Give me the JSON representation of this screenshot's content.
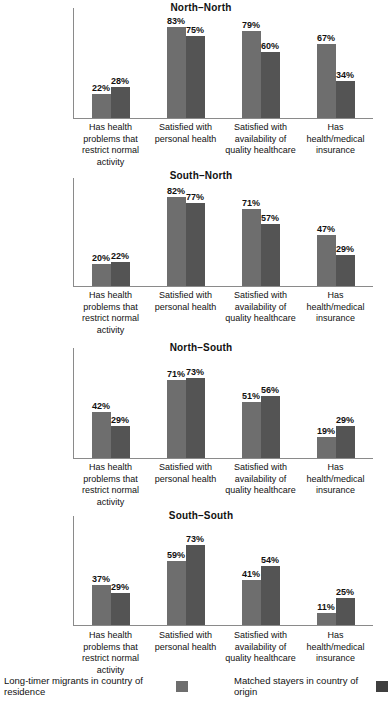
{
  "chart_data": {
    "type": "bar",
    "title": "",
    "xlabel": "",
    "ylabel": "",
    "ylim": [
      0,
      100
    ],
    "grid": false,
    "legend_position": "bottom",
    "categories": [
      "Has health problems that restrict normal activity",
      "Satisfied with personal health",
      "Satisfied with availability of quality healthcare",
      "Has health/medical insurance"
    ],
    "series_names": [
      "Long-timer migrants in country of residence",
      "Matched stayers in country of origin"
    ],
    "panels": [
      {
        "title": "North–North",
        "series": [
          {
            "name": "Long-timer migrants in country of residence",
            "values": [
              22,
              83,
              79,
              67
            ],
            "labels": [
              "22%",
              "83%",
              "79%",
              "67%"
            ]
          },
          {
            "name": "Matched stayers in country of origin",
            "values": [
              28,
              75,
              60,
              34
            ],
            "labels": [
              "28%",
              "75%",
              "60%",
              "34%"
            ]
          }
        ]
      },
      {
        "title": "South–North",
        "series": [
          {
            "name": "Long-timer migrants in country of residence",
            "values": [
              20,
              82,
              71,
              47
            ],
            "labels": [
              "20%",
              "82%",
              "71%",
              "47%"
            ]
          },
          {
            "name": "Matched stayers in country of origin",
            "values": [
              22,
              77,
              57,
              29
            ],
            "labels": [
              "22%",
              "77%",
              "57%",
              "29%"
            ]
          }
        ]
      },
      {
        "title": "North–South",
        "series": [
          {
            "name": "Long-timer migrants in country of residence",
            "values": [
              42,
              71,
              51,
              19
            ],
            "labels": [
              "42%",
              "71%",
              "51%",
              "19%"
            ]
          },
          {
            "name": "Matched stayers in country of origin",
            "values": [
              29,
              73,
              56,
              29
            ],
            "labels": [
              "29%",
              "73%",
              "56%",
              "29%"
            ]
          }
        ]
      },
      {
        "title": "South–South",
        "series": [
          {
            "name": "Long-timer migrants in country of residence",
            "values": [
              37,
              59,
              41,
              11
            ],
            "labels": [
              "37%",
              "59%",
              "41%",
              "11%"
            ]
          },
          {
            "name": "Matched stayers in country of origin",
            "values": [
              29,
              73,
              54,
              25
            ],
            "labels": [
              "29%",
              "73%",
              "54%",
              "25%"
            ]
          }
        ]
      }
    ]
  },
  "legend": {
    "items": [
      {
        "label": "Long-timer migrants in country of residence",
        "color": "#6e6e6e"
      },
      {
        "label": "Matched stayers in country of origin",
        "color": "#3f3f3f"
      }
    ]
  },
  "colors": {
    "series1": "#6e6e6e",
    "series2": "#545454",
    "axis": "#8a8a8a",
    "text": "#111111",
    "background": "#ffffff"
  }
}
